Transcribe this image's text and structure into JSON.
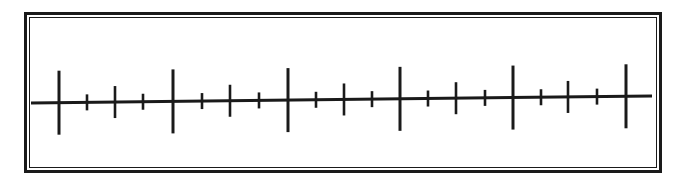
{
  "diagram": {
    "type": "number-line",
    "colors": {
      "line": "#1a1a1a",
      "background": "#ffffff"
    },
    "axis": {
      "x_start": 31,
      "x_end": 652,
      "y_start": 103,
      "y_end": 96
    },
    "ticks": [
      {
        "x": 59,
        "size": "major"
      },
      {
        "x": 87,
        "size": "minor"
      },
      {
        "x": 115,
        "size": "medium"
      },
      {
        "x": 143,
        "size": "minor"
      },
      {
        "x": 173,
        "size": "major"
      },
      {
        "x": 202,
        "size": "minor"
      },
      {
        "x": 230,
        "size": "medium"
      },
      {
        "x": 259,
        "size": "minor"
      },
      {
        "x": 288,
        "size": "major"
      },
      {
        "x": 316,
        "size": "minor"
      },
      {
        "x": 344,
        "size": "medium"
      },
      {
        "x": 372,
        "size": "minor"
      },
      {
        "x": 400,
        "size": "major"
      },
      {
        "x": 428,
        "size": "minor"
      },
      {
        "x": 456,
        "size": "medium"
      },
      {
        "x": 485,
        "size": "minor"
      },
      {
        "x": 513,
        "size": "major"
      },
      {
        "x": 541,
        "size": "minor"
      },
      {
        "x": 568,
        "size": "medium"
      },
      {
        "x": 597,
        "size": "minor"
      },
      {
        "x": 626,
        "size": "major"
      }
    ],
    "tick_half_lengths": {
      "major": 32,
      "medium": 16,
      "minor": 8
    },
    "labels": []
  }
}
